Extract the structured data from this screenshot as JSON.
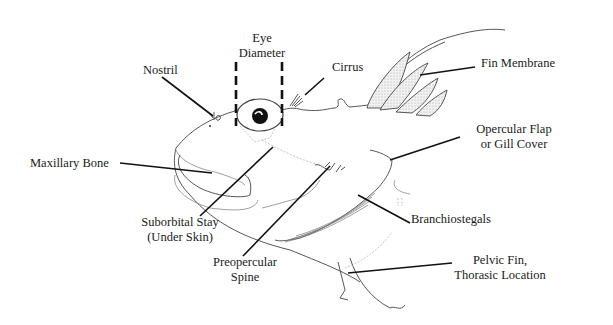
{
  "diagram": {
    "labels": {
      "eye_diameter": [
        "Eye",
        "Diameter"
      ],
      "nostril": "Nostril",
      "cirrus": "Cirrus",
      "fin_membrane": "Fin Membrane",
      "opercular_flap": [
        "Opercular Flap",
        "or Gill Cover"
      ],
      "maxillary_bone": "Maxillary Bone",
      "suborbital_stay": [
        "Suborbital Stay",
        "(Under Skin)"
      ],
      "branchiostegals": "Branchiostegals",
      "preopercular_spine": [
        "Preopercular",
        "Spine"
      ],
      "pelvic_fin": [
        "Pelvic Fin,",
        "Thorasic Location"
      ]
    },
    "colors": {
      "background": "#ffffff",
      "ink": "#111111",
      "stipple": "#d8d8d8"
    }
  }
}
